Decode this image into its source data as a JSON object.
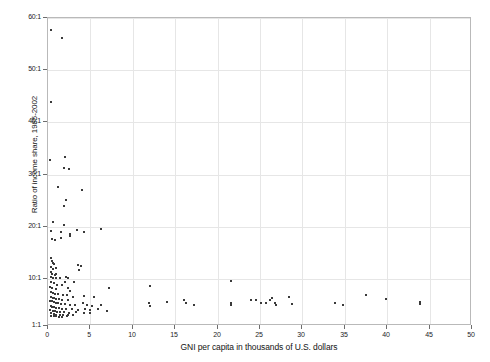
{
  "chart_data": {
    "type": "scatter",
    "title": "",
    "xlabel": "GNI per capita in thousands of U.S. dollars",
    "ylabel": "Ratio of income share, 1985-2002",
    "xlim": [
      0,
      50
    ],
    "ylim": [
      1,
      60
    ],
    "xticks": [
      0,
      5,
      10,
      15,
      20,
      25,
      30,
      35,
      40,
      45,
      50
    ],
    "xticklabels": [
      "0",
      "5",
      "10",
      "15",
      "20",
      "25",
      "30",
      "35",
      "40",
      "45",
      "50"
    ],
    "yticks": [
      1,
      10,
      20,
      30,
      40,
      50,
      60
    ],
    "yticklabels": [
      "1:1",
      "10:1",
      "20:1",
      "30:1",
      "40:1",
      "50:1",
      "60:1"
    ],
    "grid": true,
    "legend": null,
    "marker_color": "#3a3a3a",
    "frame_color": "#b9b9b9",
    "grid_color": "#e6e6e6",
    "points": [
      [
        0.3,
        57.7
      ],
      [
        1.6,
        56.2
      ],
      [
        0.4,
        44.0
      ],
      [
        0.2,
        32.8
      ],
      [
        2.0,
        33.3
      ],
      [
        1.9,
        31.2
      ],
      [
        2.5,
        31.1
      ],
      [
        1.2,
        27.6
      ],
      [
        2.1,
        25.2
      ],
      [
        1.9,
        24.0
      ],
      [
        4.0,
        27.0
      ],
      [
        0.6,
        21.0
      ],
      [
        1.9,
        20.3
      ],
      [
        0.4,
        19.2
      ],
      [
        1.5,
        19.0
      ],
      [
        2.6,
        18.6
      ],
      [
        3.4,
        19.3
      ],
      [
        4.2,
        19.0
      ],
      [
        6.2,
        19.6
      ],
      [
        0.5,
        17.6
      ],
      [
        0.8,
        17.4
      ],
      [
        1.5,
        17.8
      ],
      [
        2.6,
        18.2
      ],
      [
        0.3,
        14.1
      ],
      [
        0.5,
        13.5
      ],
      [
        0.55,
        13.0
      ],
      [
        0.7,
        12.8
      ],
      [
        0.4,
        12.3
      ],
      [
        0.6,
        12.0
      ],
      [
        0.9,
        12.2
      ],
      [
        3.5,
        12.6
      ],
      [
        3.9,
        12.4
      ],
      [
        3.6,
        11.7
      ],
      [
        0.3,
        11.3
      ],
      [
        0.45,
        11.0
      ],
      [
        0.8,
        10.8
      ],
      [
        1.0,
        11.0
      ],
      [
        0.35,
        10.4
      ],
      [
        0.6,
        10.2
      ],
      [
        0.95,
        10.1
      ],
      [
        1.4,
        10.2
      ],
      [
        2.1,
        10.4
      ],
      [
        2.4,
        10.1
      ],
      [
        2.0,
        9.5
      ],
      [
        3.1,
        9.4
      ],
      [
        0.4,
        9.4
      ],
      [
        0.7,
        9.2
      ],
      [
        1.1,
        8.9
      ],
      [
        1.6,
        8.8
      ],
      [
        0.25,
        8.5
      ],
      [
        0.5,
        8.3
      ],
      [
        0.9,
        8.1
      ],
      [
        2.3,
        8.3
      ],
      [
        2.6,
        7.7
      ],
      [
        7.2,
        8.2
      ],
      [
        12.0,
        8.6
      ],
      [
        21.6,
        9.7
      ],
      [
        0.3,
        7.5
      ],
      [
        0.6,
        7.3
      ],
      [
        0.85,
        7.2
      ],
      [
        1.2,
        7.1
      ],
      [
        1.8,
        7.0
      ],
      [
        2.2,
        6.9
      ],
      [
        2.9,
        6.6
      ],
      [
        4.3,
        6.8
      ],
      [
        5.4,
        6.6
      ],
      [
        0.35,
        6.5
      ],
      [
        0.55,
        6.4
      ],
      [
        0.75,
        6.3
      ],
      [
        1.0,
        6.2
      ],
      [
        1.35,
        6.1
      ],
      [
        1.7,
        6.0
      ],
      [
        2.4,
        5.9
      ],
      [
        0.2,
        5.8
      ],
      [
        0.45,
        5.7
      ],
      [
        0.65,
        5.6
      ],
      [
        0.9,
        5.5
      ],
      [
        1.15,
        5.4
      ],
      [
        1.5,
        5.3
      ],
      [
        2.0,
        5.2
      ],
      [
        2.6,
        5.1
      ],
      [
        3.2,
        5.0
      ],
      [
        4.1,
        5.4
      ],
      [
        4.6,
        5.1
      ],
      [
        5.2,
        4.9
      ],
      [
        6.3,
        5.0
      ],
      [
        11.9,
        5.4
      ],
      [
        12.0,
        4.9
      ],
      [
        14.0,
        5.6
      ],
      [
        16.0,
        5.9
      ],
      [
        16.3,
        5.5
      ],
      [
        17.2,
        5.1
      ],
      [
        21.6,
        5.5
      ],
      [
        21.6,
        5.0
      ],
      [
        23.9,
        6.0
      ],
      [
        24.5,
        5.9
      ],
      [
        25.1,
        5.4
      ],
      [
        25.7,
        5.5
      ],
      [
        26.2,
        6.0
      ],
      [
        26.4,
        6.3
      ],
      [
        26.8,
        5.5
      ],
      [
        26.9,
        5.1
      ],
      [
        28.4,
        6.6
      ],
      [
        28.8,
        5.3
      ],
      [
        33.9,
        5.4
      ],
      [
        34.8,
        5.0
      ],
      [
        37.5,
        7.0
      ],
      [
        39.9,
        6.1
      ],
      [
        43.9,
        5.6
      ],
      [
        43.9,
        5.2
      ],
      [
        0.3,
        4.8
      ],
      [
        0.5,
        4.7
      ],
      [
        0.7,
        4.6
      ],
      [
        0.95,
        4.5
      ],
      [
        1.25,
        4.4
      ],
      [
        1.6,
        4.3
      ],
      [
        2.1,
        4.3
      ],
      [
        2.8,
        4.2
      ],
      [
        3.5,
        4.1
      ],
      [
        4.4,
        4.2
      ],
      [
        5.0,
        4.0
      ],
      [
        5.9,
        4.2
      ],
      [
        7.0,
        3.8
      ],
      [
        0.25,
        4.0
      ],
      [
        0.55,
        3.9
      ],
      [
        0.8,
        3.8
      ],
      [
        1.1,
        3.7
      ],
      [
        1.45,
        3.6
      ],
      [
        1.9,
        3.6
      ],
      [
        2.5,
        3.5
      ],
      [
        3.3,
        3.6
      ],
      [
        4.2,
        3.5
      ],
      [
        4.9,
        3.4
      ],
      [
        0.4,
        3.4
      ],
      [
        0.7,
        3.3
      ],
      [
        1.0,
        3.2
      ],
      [
        1.4,
        3.2
      ],
      [
        1.8,
        3.1
      ],
      [
        2.3,
        3.1
      ],
      [
        3.0,
        3.2
      ],
      [
        0.35,
        3.0
      ],
      [
        0.65,
        2.9
      ],
      [
        0.95,
        2.9
      ],
      [
        1.3,
        2.8
      ],
      [
        1.7,
        2.8
      ],
      [
        2.2,
        2.9
      ]
    ]
  }
}
